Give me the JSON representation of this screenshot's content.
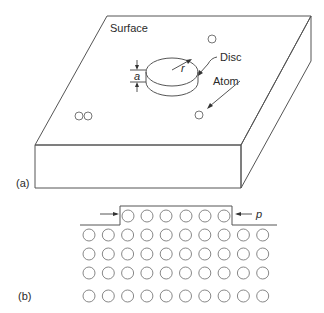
{
  "figure": {
    "panel_a": {
      "label": "(a)",
      "surface_label": "Surface",
      "disc_label": "Disc",
      "atom_label": "Atom",
      "radius_symbol": "r",
      "height_symbol": "a"
    },
    "panel_b": {
      "label": "(b)",
      "step_symbol": "p",
      "top_row_count": 6,
      "lattice_columns": 10,
      "lattice_rows": 4
    }
  }
}
